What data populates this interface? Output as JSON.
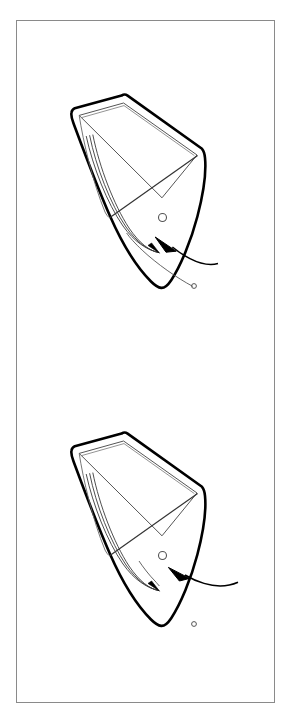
{
  "page": {
    "background_color": "#ffffff",
    "width": 286,
    "height": 724
  },
  "frame": {
    "label": "",
    "border_color": "#8a8a8a",
    "border_width": 1,
    "x": 16,
    "y": 20,
    "width": 259,
    "height": 683
  },
  "diagram": {
    "type": "technical-line-drawing",
    "stroke_color": "#000000",
    "detail_stroke_color": "#3a3a3a",
    "fill_color": "#ffffff",
    "figures": [
      {
        "id": "figure-top",
        "name": "boat-figure-upper",
        "label": "",
        "hull_rotation_deg": 28,
        "arrow_direction": "left",
        "arrow_curve": "concave-up",
        "elements": [
          "hull-outline",
          "deck-panel",
          "thwart-line",
          "sweep-lines",
          "bow-eye-circle",
          "stern-eye-circle",
          "pointer-arrow",
          "direction-arrow"
        ]
      },
      {
        "id": "figure-bottom",
        "name": "boat-figure-lower",
        "label": "",
        "hull_rotation_deg": 28,
        "arrow_direction": "left",
        "arrow_curve": "concave-up",
        "elements": [
          "hull-outline",
          "deck-panel",
          "thwart-line",
          "sweep-lines",
          "bow-eye-circle",
          "stern-eye-circle",
          "pointer-arrow",
          "direction-arrow"
        ]
      }
    ]
  }
}
